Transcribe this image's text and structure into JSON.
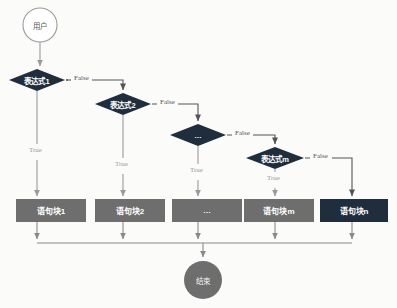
{
  "diagram": {
    "type": "flowchart",
    "orientation": "top-down",
    "background_color": "#fbfbfa",
    "palette": {
      "decision_fill": "#1f2d3d",
      "decision_text": "#ffffff",
      "block_fill": "#6e6e6e",
      "block_last_fill": "#1f2d3d",
      "block_text": "#ffffff",
      "start_fill": "#ffffff",
      "start_stroke": "#9a9a9a",
      "start_text": "#5a5a5a",
      "end_fill": "#6e6e6e",
      "end_text": "#f2f2f2",
      "edge_false": "#555555",
      "edge_true": "#9a9a9a"
    }
  },
  "nodes": {
    "start": {
      "id": "start",
      "shape": "circle",
      "label": "用户",
      "cx": 40,
      "cy": 25,
      "r": 17
    },
    "decisions": [
      {
        "id": "d1",
        "shape": "diamond",
        "label": "表达式1",
        "cx": 37,
        "cy": 80,
        "w": 56,
        "h": 22
      },
      {
        "id": "d2",
        "shape": "diamond",
        "label": "表达式2",
        "cx": 123,
        "cy": 104,
        "w": 56,
        "h": 22
      },
      {
        "id": "d3",
        "shape": "diamond",
        "label": "…",
        "cx": 198,
        "cy": 135,
        "w": 56,
        "h": 22
      },
      {
        "id": "d4",
        "shape": "diamond",
        "label": "表达式m",
        "cx": 275,
        "cy": 158,
        "w": 58,
        "h": 22
      }
    ],
    "blocks": [
      {
        "id": "b1",
        "shape": "rect",
        "label": "语句块1",
        "x": 16,
        "y": 199,
        "w": 70,
        "h": 23,
        "fill": "#6e6e6e"
      },
      {
        "id": "b2",
        "shape": "rect",
        "label": "语句块2",
        "x": 95,
        "y": 199,
        "w": 70,
        "h": 23,
        "fill": "#6e6e6e"
      },
      {
        "id": "b3",
        "shape": "rect",
        "label": "…",
        "x": 172,
        "y": 199,
        "w": 70,
        "h": 23,
        "fill": "#6e6e6e"
      },
      {
        "id": "b4",
        "shape": "rect",
        "label": "语句块m",
        "x": 244,
        "y": 199,
        "w": 70,
        "h": 23,
        "fill": "#6e6e6e"
      },
      {
        "id": "b5",
        "shape": "rect",
        "label": "语句块n",
        "x": 320,
        "y": 199,
        "w": 68,
        "h": 23,
        "fill": "#1f2d3d"
      }
    ],
    "end": {
      "id": "end",
      "shape": "circle",
      "label": "结束",
      "cx": 203,
      "cy": 280,
      "r": 19
    }
  },
  "edges": [
    {
      "id": "e-start-d1",
      "from": "start",
      "to": "d1",
      "label": "",
      "kind": "flow"
    },
    {
      "id": "e-d1-false",
      "from": "d1",
      "to": "d2",
      "label": "False",
      "kind": "false",
      "label_x": 74,
      "label_y": 73
    },
    {
      "id": "e-d1-true",
      "from": "d1",
      "to": "b1",
      "label": "True",
      "kind": "true",
      "label_x": 41,
      "label_y": 152
    },
    {
      "id": "e-d2-false",
      "from": "d2",
      "to": "d3",
      "label": "False",
      "kind": "false",
      "label_x": 160,
      "label_y": 97
    },
    {
      "id": "e-d2-true",
      "from": "d2",
      "to": "b2",
      "label": "True",
      "kind": "true",
      "label_x": 127,
      "label_y": 166
    },
    {
      "id": "e-d3-false",
      "from": "d3",
      "to": "d4",
      "label": "False",
      "kind": "false",
      "label_x": 234,
      "label_y": 128
    },
    {
      "id": "e-d3-true",
      "from": "d3",
      "to": "b3",
      "label": "True",
      "kind": "true",
      "label_x": 202,
      "label_y": 172
    },
    {
      "id": "e-d4-false",
      "from": "d4",
      "to": "b5",
      "label": "False",
      "kind": "false",
      "label_x": 313,
      "label_y": 151
    },
    {
      "id": "e-d4-true",
      "from": "d4",
      "to": "b4",
      "label": "True",
      "kind": "true",
      "label_x": 279,
      "label_y": 180
    },
    {
      "id": "e-b1-end",
      "from": "b1",
      "to": "end",
      "label": "",
      "kind": "merge"
    },
    {
      "id": "e-b2-end",
      "from": "b2",
      "to": "end",
      "label": "",
      "kind": "merge"
    },
    {
      "id": "e-b3-end",
      "from": "b3",
      "to": "end",
      "label": "",
      "kind": "merge"
    },
    {
      "id": "e-b4-end",
      "from": "b4",
      "to": "end",
      "label": "",
      "kind": "merge"
    },
    {
      "id": "e-b5-end",
      "from": "b5",
      "to": "end",
      "label": "",
      "kind": "merge"
    }
  ],
  "labels": {
    "start": "用户",
    "end": "结束",
    "d1": "表达式1",
    "d2": "表达式2",
    "d3": "…",
    "d4": "表达式m",
    "b1": "语句块1",
    "b2": "语句块2",
    "b3": "…",
    "b4": "语句块m",
    "b5": "语句块n",
    "false1": "False",
    "false2": "False",
    "false3": "False",
    "false4": "False",
    "true1": "True",
    "true2": "True",
    "true3": "True",
    "true4": "True"
  }
}
